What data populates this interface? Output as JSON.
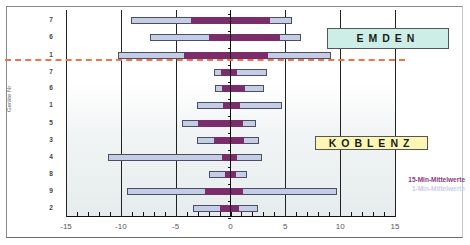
{
  "chart_data": {
    "type": "bar",
    "subtype": "horizontal-floating-range",
    "title": "",
    "xlabel": "",
    "ylabel": "Geräte Nr",
    "xlim": [
      -15,
      15
    ],
    "x_ticks": [
      -15,
      -10,
      -5,
      0,
      5,
      10,
      15
    ],
    "x_minor_step": 1,
    "grid": "vertical major gridlines",
    "categories": [
      "7",
      "6",
      "1",
      "7",
      "6",
      "1",
      "5",
      "3",
      "4",
      "8",
      "9",
      "2"
    ],
    "groups": [
      {
        "name": "EMDEN",
        "rows": [
          0,
          1,
          2
        ],
        "color": "#cdeee6"
      },
      {
        "name": "KOBLENZ",
        "rows": [
          3,
          4,
          5,
          6,
          7,
          8,
          9,
          10,
          11
        ],
        "color": "#fbf6b4"
      }
    ],
    "series": [
      {
        "name": "1-Min-Mittelwerte",
        "color": "#c5cde6",
        "ranges": [
          [
            -9.1,
            5.6
          ],
          [
            -7.3,
            6.4
          ],
          [
            -10.3,
            9.2
          ],
          [
            -1.5,
            3.3
          ],
          [
            -1.4,
            3.1
          ],
          [
            -3.1,
            4.7
          ],
          [
            -4.4,
            2.3
          ],
          [
            -3.1,
            2.6
          ],
          [
            -11.2,
            2.9
          ],
          [
            -2.0,
            1.5
          ],
          [
            -9.4,
            9.7
          ],
          [
            -3.4,
            2.5
          ]
        ]
      },
      {
        "name": "15-Min-Mittelwerte",
        "color": "#7a2d6a",
        "ranges": [
          [
            -3.6,
            3.6
          ],
          [
            -2.0,
            4.5
          ],
          [
            -4.2,
            3.4
          ],
          [
            -0.9,
            0.6
          ],
          [
            -0.8,
            1.3
          ],
          [
            -0.7,
            0.9
          ],
          [
            -3.0,
            1.1
          ],
          [
            -1.5,
            1.2
          ],
          [
            -0.8,
            0.6
          ],
          [
            -0.5,
            0.5
          ],
          [
            -2.3,
            1.1
          ],
          [
            -1.0,
            0.8
          ]
        ]
      }
    ],
    "legend_position": "right-bottom",
    "divider": {
      "type": "dashed",
      "color": "#f0734a",
      "between_rows": [
        2,
        3
      ]
    }
  },
  "labels": {
    "emden": "EMDEN",
    "koblenz": "KOBLENZ",
    "legend_15": "15-Min-Mittelwerte",
    "legend_1": "1-Min-Mittelwerte",
    "yaxis_title": "Geräte Nr"
  }
}
